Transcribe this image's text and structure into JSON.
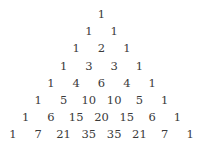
{
  "diagram": {
    "rows": [
      [
        1
      ],
      [
        1,
        1
      ],
      [
        1,
        2,
        1
      ],
      [
        1,
        3,
        3,
        1
      ],
      [
        1,
        4,
        6,
        4,
        1
      ],
      [
        1,
        5,
        10,
        10,
        5,
        1
      ],
      [
        1,
        6,
        15,
        20,
        15,
        6,
        1
      ],
      [
        1,
        7,
        21,
        35,
        35,
        21,
        7,
        1
      ]
    ],
    "text_color": "#3a3a3a",
    "background": "#ffffff"
  }
}
